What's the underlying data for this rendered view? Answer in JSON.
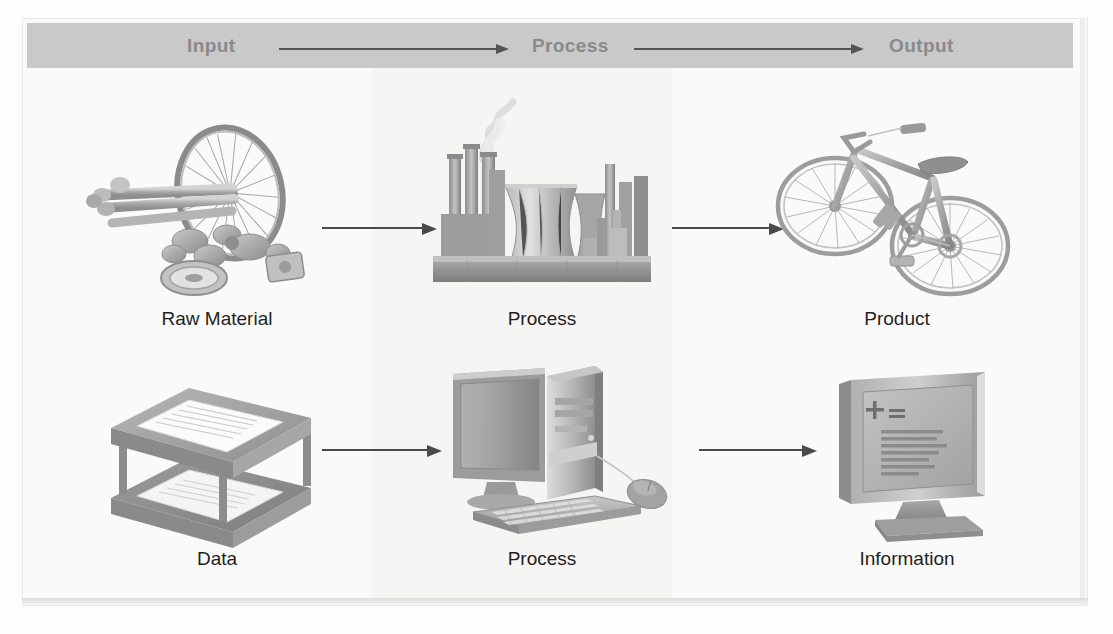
{
  "diagram": {
    "title": "Input Process Output",
    "header": {
      "stages": [
        {
          "id": "input",
          "label": "Input"
        },
        {
          "id": "process",
          "label": "Process"
        },
        {
          "id": "output",
          "label": "Output"
        }
      ],
      "arrows": [
        {
          "id": "header-arrow-1",
          "from": "Input",
          "to": "Process"
        },
        {
          "id": "header-arrow-2",
          "from": "Process",
          "to": "Output"
        }
      ],
      "band_color": "#c9c9c9",
      "text_color": "#8a8a8a"
    },
    "rows": [
      {
        "id": "physical-row",
        "cells": [
          {
            "id": "raw-material",
            "label": "Raw Material",
            "icon": "bicycle-parts-icon"
          },
          {
            "id": "factory-process",
            "label": "Process",
            "icon": "factory-icon"
          },
          {
            "id": "product",
            "label": "Product",
            "icon": "bicycle-icon"
          }
        ],
        "arrows": [
          {
            "id": "row1-arrow-1",
            "from": "Raw Material",
            "to": "Process"
          },
          {
            "id": "row1-arrow-2",
            "from": "Process",
            "to": "Product"
          }
        ]
      },
      {
        "id": "information-row",
        "cells": [
          {
            "id": "data",
            "label": "Data",
            "icon": "paper-trays-icon"
          },
          {
            "id": "computer-process",
            "label": "Process",
            "icon": "desktop-computer-icon"
          },
          {
            "id": "information",
            "label": "Information",
            "icon": "monitor-report-icon"
          }
        ],
        "arrows": [
          {
            "id": "row2-arrow-1",
            "from": "Data",
            "to": "Process"
          },
          {
            "id": "row2-arrow-2",
            "from": "Process",
            "to": "Information"
          }
        ]
      }
    ],
    "monitor_screen": {
      "formula": "+=",
      "text_lines": 7
    },
    "colors": {
      "page_background": "#fafafa",
      "header_band": "#c9c9c9",
      "middle_band": "#f5f5f3",
      "arrow": "#4a4a4a",
      "label_text": "#1f1f1f",
      "artwork_grey": "#9a9a9a"
    }
  }
}
